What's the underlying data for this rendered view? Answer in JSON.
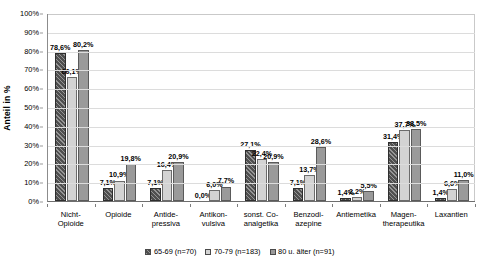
{
  "chart_data": {
    "type": "bar",
    "title": "",
    "xlabel": "",
    "ylabel": "Anteil in %",
    "ylim": [
      0,
      100
    ],
    "grid": true,
    "legend_position": "bottom",
    "ytick_labels": [
      "100%",
      "90%",
      "80%",
      "70%",
      "60%",
      "50%",
      "40%",
      "30%",
      "20%",
      "10%",
      "0%"
    ],
    "ytick_values": [
      100,
      90,
      80,
      70,
      60,
      50,
      40,
      30,
      20,
      10,
      0
    ],
    "categories": [
      "Nicht-\nOpioide",
      "Opioide",
      "Antide-\npressiva",
      "Antikon-\nvulsiva",
      "sonst. Co-\nanalgetika",
      "Benzodi-\nazepine",
      "Antiemetika",
      "Magen-\ntherapeutika",
      "Laxantien"
    ],
    "series": [
      {
        "name": "65-69 (n=70)",
        "color": "#4f4f4f",
        "pattern": "diagonal-hatch",
        "values": [
          78.6,
          7.1,
          7.1,
          0.0,
          27.1,
          7.1,
          1.4,
          31.4,
          1.4
        ],
        "labels": [
          "78,6%",
          "7,1%",
          "7,1%",
          "0,0%",
          "27,1%",
          "7,1%",
          "1,4%",
          "31,4%",
          "1,4%"
        ]
      },
      {
        "name": "70-79 (n=183)",
        "color": "#d3d3d3",
        "pattern": "solid",
        "values": [
          66.1,
          10.9,
          16.4,
          6.0,
          22.4,
          13.7,
          2.2,
          37.7,
          6.6
        ],
        "labels": [
          "66,1%",
          "10,9%",
          "16,4%",
          "6,0%",
          "22,4%",
          "13,7%",
          "2,2%",
          "37,7%",
          "6,6%"
        ]
      },
      {
        "name": "80 u. älter (n=91)",
        "color": "#9a9a9a",
        "pattern": "solid",
        "values": [
          80.2,
          19.8,
          20.9,
          7.7,
          20.9,
          28.6,
          5.5,
          38.5,
          11.0
        ],
        "labels": [
          "80,2%",
          "19,8%",
          "20,9%",
          "7,7%",
          "20,9%",
          "28,6%",
          "5,5%",
          "38,5%",
          "11,0%"
        ]
      }
    ]
  }
}
